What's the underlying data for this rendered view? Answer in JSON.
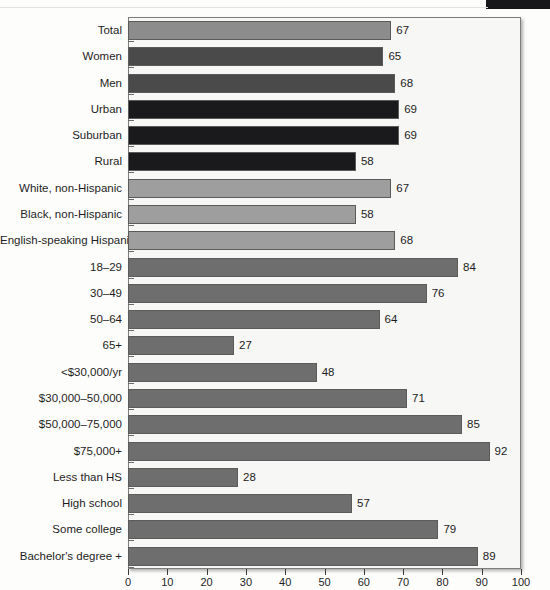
{
  "chart_data": {
    "type": "bar",
    "orientation": "horizontal",
    "title": "",
    "subtitle": "",
    "xlabel": "",
    "ylabel": "",
    "xlim": [
      0,
      100
    ],
    "xticks": [
      0,
      10,
      20,
      30,
      40,
      50,
      60,
      70,
      80,
      90,
      100
    ],
    "xtick_labels": [
      "0",
      "10",
      "20",
      "30",
      "40",
      "50",
      "60",
      "70",
      "80",
      "90",
      "100"
    ],
    "grid": false,
    "legend": "none",
    "show_data_labels": true,
    "categories": [
      "Total",
      "Women",
      "Men",
      "Urban",
      "Suburban",
      "Rural",
      "White, non-Hispanic",
      "Black, non-Hispanic",
      "English-speaking Hispanic",
      "18–29",
      "30–49",
      "50–64",
      "65+",
      "<$30,000/yr",
      "$30,000–50,000",
      "$50,000–75,000",
      "$75,000+",
      "Less than HS",
      "High school",
      "Some college",
      "Bachelor's degree +"
    ],
    "values": [
      67,
      65,
      68,
      69,
      69,
      58,
      67,
      58,
      68,
      84,
      76,
      64,
      27,
      48,
      71,
      85,
      92,
      28,
      57,
      79,
      89
    ],
    "bar_colors": [
      "#8c8c8c",
      "#4a4a4a",
      "#4a4a4a",
      "#1a1a1c",
      "#1a1a1c",
      "#1a1a1c",
      "#9e9e9e",
      "#9e9e9e",
      "#9e9e9e",
      "#6e6e6e",
      "#6e6e6e",
      "#6e6e6e",
      "#6e6e6e",
      "#6e6e6e",
      "#6e6e6e",
      "#6e6e6e",
      "#6e6e6e",
      "#6e6e6e",
      "#6e6e6e",
      "#6e6e6e",
      "#6e6e6e"
    ],
    "value_labels": [
      "67",
      "65",
      "68",
      "69",
      "69",
      "58",
      "67",
      "58",
      "68",
      "84",
      "76",
      "64",
      "27",
      "48",
      "71",
      "85",
      "92",
      "28",
      "57",
      "79",
      "89"
    ]
  },
  "palette": {
    "page_background": "#fdfdfc",
    "plot_background": "#f7f7f5",
    "plot_border": "#7d7d7d",
    "bar_outline": "#5b5b5b",
    "text": "#1d1d1d",
    "axis": "#3a3a3a",
    "scan_artifact": "#18181a"
  }
}
